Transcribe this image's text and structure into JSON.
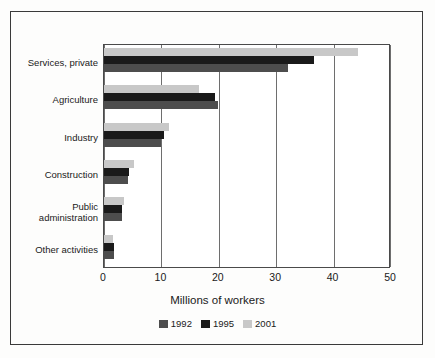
{
  "chart_data": {
    "type": "bar",
    "orientation": "horizontal",
    "title": "",
    "xlabel": "Millions of workers",
    "ylabel": "",
    "xlim": [
      0,
      50
    ],
    "xticks": [
      0,
      10,
      20,
      30,
      40,
      50
    ],
    "xtick_labels": [
      "0",
      "10",
      "20",
      "30",
      "40",
      "50"
    ],
    "grid": "vertical",
    "legend_position": "bottom",
    "categories": [
      "Services, private",
      "Agriculture",
      "Industry",
      "Construction",
      "Public administration",
      "Other activities"
    ],
    "series": [
      {
        "name": "1992",
        "color": "#4d4d4d",
        "values": [
          32.0,
          19.8,
          10.0,
          4.2,
          3.1,
          1.7
        ]
      },
      {
        "name": "1995",
        "color": "#1a1a1a",
        "values": [
          36.5,
          19.3,
          10.4,
          4.3,
          3.2,
          1.7
        ]
      },
      {
        "name": "2001",
        "color": "#c8c8c8",
        "values": [
          44.2,
          16.5,
          11.3,
          5.2,
          3.5,
          1.6
        ]
      }
    ]
  },
  "category_labels": [
    {
      "line1": "Services, private",
      "line2": ""
    },
    {
      "line1": "Agriculture",
      "line2": ""
    },
    {
      "line1": "Industry",
      "line2": ""
    },
    {
      "line1": "Construction",
      "line2": ""
    },
    {
      "line1": "Public",
      "line2": "administration"
    },
    {
      "line1": "Other activities",
      "line2": ""
    }
  ],
  "legend": [
    {
      "label": "1992",
      "color": "#4d4d4d"
    },
    {
      "label": "1995",
      "color": "#1a1a1a"
    },
    {
      "label": "2001",
      "color": "#c8c8c8"
    }
  ],
  "colors": {
    "frame": "#3a3a3a",
    "axis": "#4a4a4a",
    "gridline": "#6e6e6e",
    "text": "#1a1a1a",
    "background": "#fdfdfc"
  }
}
